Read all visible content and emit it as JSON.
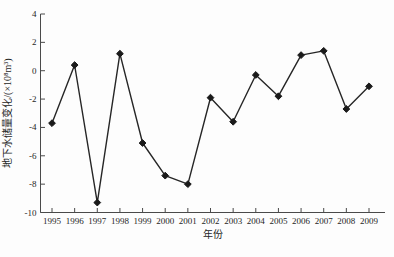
{
  "figure": {
    "background": "#fdfdfd",
    "width": 394,
    "height": 257
  },
  "chart_data": {
    "type": "line",
    "title": "",
    "xlabel": "年份",
    "ylabel": "地下水储量变化/(×10⁸m³)",
    "x": [
      1995,
      1996,
      1997,
      1998,
      1999,
      2000,
      2001,
      2002,
      2003,
      2004,
      2005,
      2006,
      2007,
      2008,
      2009
    ],
    "series": [
      {
        "name": "地下水储量变化",
        "values": [
          -3.7,
          0.4,
          -9.3,
          1.2,
          -5.1,
          -7.4,
          -8.0,
          -1.9,
          -3.6,
          -0.3,
          -1.8,
          1.1,
          1.4,
          -2.7,
          -1.1
        ]
      }
    ],
    "ylim": [
      -10,
      4
    ],
    "yticks": [
      4,
      2,
      0,
      -2,
      -4,
      -6,
      -8,
      -10
    ],
    "grid": false,
    "legend_position": "none",
    "marker": "diamond",
    "line_color": "#262626",
    "marker_color": "#1a1a1a",
    "axis_color": "#4a4a4a",
    "text_color": "#262626"
  }
}
